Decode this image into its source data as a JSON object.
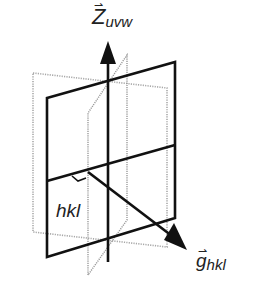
{
  "diagram": {
    "axis_label": {
      "main": "Z",
      "sub": "uvw"
    },
    "vector_label": {
      "main": "g",
      "sub": "hkl"
    },
    "plane_label": "hkl",
    "colors": {
      "solid": "#111111",
      "dotted": "#9a9a9a",
      "thin": "#8c8c8c"
    }
  }
}
